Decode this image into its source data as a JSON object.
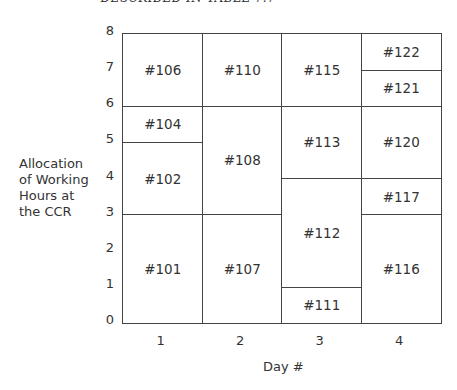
{
  "caption": "DESCRIBED IN TABLE 7.7",
  "chart_data": {
    "type": "table",
    "title": "",
    "xlabel": "Day #",
    "ylabel_lines": [
      "Allocation",
      "of Working",
      "Hours at",
      "the CCR"
    ],
    "x_ticks": [
      "1",
      "2",
      "3",
      "4"
    ],
    "y_ticks": [
      "0",
      "1",
      "2",
      "3",
      "4",
      "5",
      "6",
      "7",
      "8"
    ],
    "ylim": [
      0,
      8
    ],
    "blocks": [
      {
        "label": "#101",
        "day": 1,
        "start": 0,
        "end": 3
      },
      {
        "label": "#102",
        "day": 1,
        "start": 3,
        "end": 5
      },
      {
        "label": "#104",
        "day": 1,
        "start": 5,
        "end": 6
      },
      {
        "label": "#106",
        "day": 1,
        "start": 6,
        "end": 8
      },
      {
        "label": "#107",
        "day": 2,
        "start": 0,
        "end": 3
      },
      {
        "label": "#108",
        "day": 2,
        "start": 3,
        "end": 6
      },
      {
        "label": "#110",
        "day": 2,
        "start": 6,
        "end": 8
      },
      {
        "label": "#111",
        "day": 3,
        "start": 0,
        "end": 1
      },
      {
        "label": "#112",
        "day": 3,
        "start": 1,
        "end": 4
      },
      {
        "label": "#113",
        "day": 3,
        "start": 4,
        "end": 6
      },
      {
        "label": "#115",
        "day": 3,
        "start": 6,
        "end": 8
      },
      {
        "label": "#116",
        "day": 4,
        "start": 0,
        "end": 3
      },
      {
        "label": "#117",
        "day": 4,
        "start": 3,
        "end": 4
      },
      {
        "label": "#120",
        "day": 4,
        "start": 4,
        "end": 6
      },
      {
        "label": "#121",
        "day": 4,
        "start": 6,
        "end": 7
      },
      {
        "label": "#122",
        "day": 4,
        "start": 7,
        "end": 8
      }
    ]
  }
}
